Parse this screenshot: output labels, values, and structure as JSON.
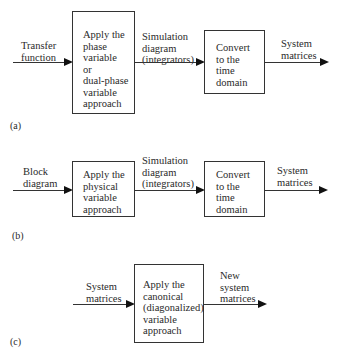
{
  "diagrams": {
    "a": {
      "label": "(a)",
      "input_label": "Transfer\nfunction",
      "box1": "Apply the\nphase\nvariable\nor\ndual-phase\nvariable\napproach",
      "mid_label": "Simulation\ndiagram\n(integrators)",
      "box2": "Convert\nto the\ntime\ndomain",
      "output_label": "System\nmatrices"
    },
    "b": {
      "label": "(b)",
      "input_label": "Block\ndiagram",
      "box1": "Apply the\nphysical\nvariable\napproach",
      "mid_label": "Simulation\ndiagram\n(integrators)",
      "box2": "Convert\nto the\ntime\ndomain",
      "output_label": "System\nmatrices"
    },
    "c": {
      "label": "(c)",
      "input_label": "System\nmatrices",
      "box1": "Apply the\ncanonical\n(diagonalized)\nvariable\napproach",
      "output_label": "New\nsystem\nmatrices"
    }
  }
}
